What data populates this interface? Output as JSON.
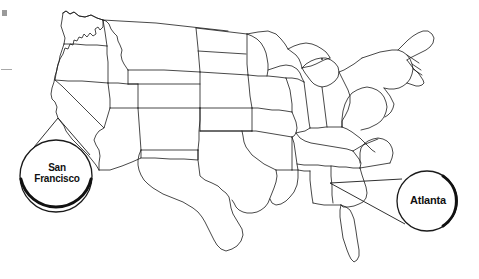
{
  "figure": {
    "type": "map",
    "region": "Contiguous United States",
    "background_color": "#ffffff",
    "outline_color": "#1a1a1a"
  },
  "callouts": [
    {
      "id": "san-francisco",
      "label_line_1": "San",
      "label_line_2": "Francisco",
      "full_label": "San Francisco",
      "circle": {
        "cx": 56,
        "cy": 176,
        "r": 36
      },
      "anchor": {
        "x": 58,
        "y": 118
      },
      "shadow_side": "bottom",
      "text_color": "#111111"
    },
    {
      "id": "atlanta",
      "label_line_1": "Atlanta",
      "label_line_2": "",
      "full_label": "Atlanta",
      "circle": {
        "cx": 427,
        "cy": 201,
        "r": 30
      },
      "anchor": {
        "x": 330,
        "y": 183
      },
      "shadow_side": "right",
      "text_color": "#111111"
    }
  ],
  "edge_marks": {
    "square_color": "#9a9a9a",
    "dash_color": "#a8a8a8"
  }
}
